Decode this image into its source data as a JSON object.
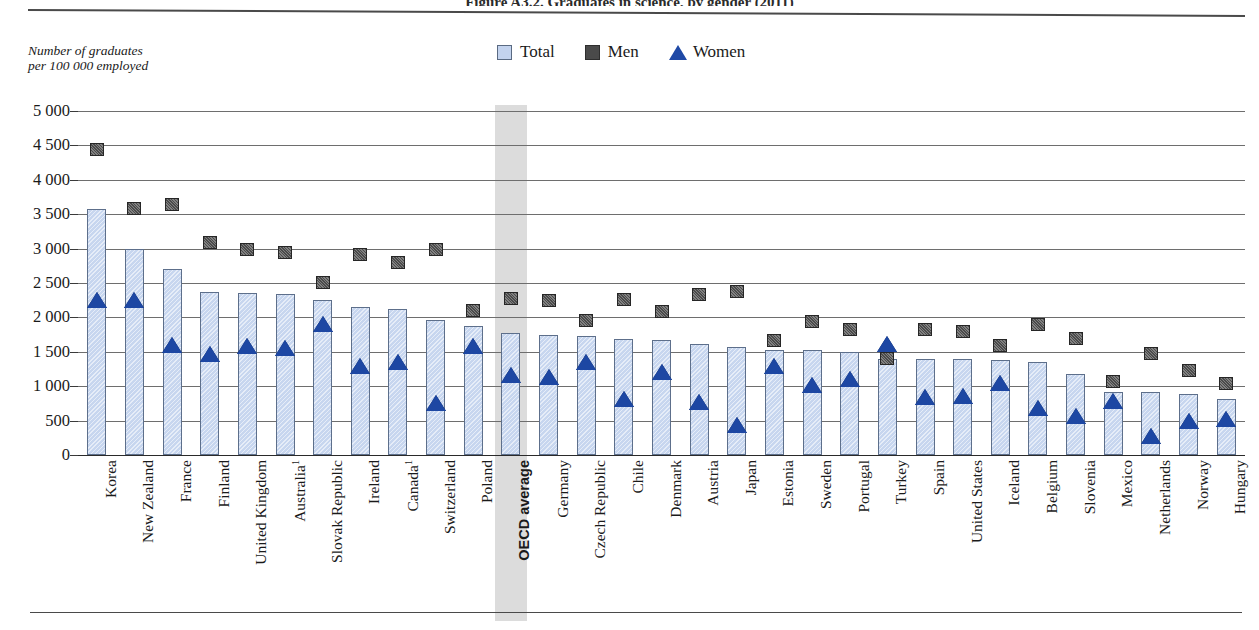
{
  "figure": {
    "top_title_partial": "Figure A3.2. Graduates in science, by gender (2011)",
    "axis_caption": "Number of graduates\nper 100 000 employed"
  },
  "legend": {
    "position": "top-center",
    "items": [
      {
        "label": "Total",
        "icon": "square-swatch-icon",
        "color": "#c3d3ee"
      },
      {
        "label": "Men",
        "icon": "square-swatch-icon",
        "color": "#4a4a4a"
      },
      {
        "label": "Women",
        "icon": "triangle-swatch-icon",
        "color": "#1f49a6"
      }
    ]
  },
  "yaxis": {
    "labels": [
      "5 000",
      "4 500",
      "4 000",
      "3 500",
      "3 000",
      "2 500",
      "2 000",
      "1 500",
      "1 000",
      "500",
      "0"
    ],
    "min": 0,
    "max": 5000,
    "step": 500
  },
  "highlight": {
    "category": "OECD average",
    "band_color": "#dcdcdc"
  },
  "chart_data": {
    "type": "bar",
    "title": "Graduates in science, by gender (2011)",
    "xlabel": "",
    "ylabel": "Number of graduates per 100 000 employed",
    "ylim": [
      0,
      5000
    ],
    "ytick_step": 500,
    "grid": true,
    "legend_position": "top-center",
    "categories": [
      "Korea",
      "New Zealand",
      "France",
      "Finland",
      "United Kingdom",
      "Australia¹",
      "Slovak Republic",
      "Ireland",
      "Canada¹",
      "Switzerland",
      "Poland",
      "OECD average",
      "Germany",
      "Czech Republic",
      "Chile",
      "Denmark",
      "Austria",
      "Japan",
      "Estonia",
      "Sweden",
      "Portugal",
      "Turkey",
      "Spain",
      "United States",
      "Iceland",
      "Belgium",
      "Slovenia",
      "Mexico",
      "Netherlands",
      "Norway",
      "Hungary"
    ],
    "series": [
      {
        "name": "Total",
        "mark": "bar",
        "color": "#c7d6ef",
        "values": [
          3570,
          2990,
          2710,
          2370,
          2360,
          2340,
          2250,
          2150,
          2120,
          1960,
          1880,
          1780,
          1740,
          1730,
          1680,
          1670,
          1610,
          1570,
          1530,
          1520,
          1500,
          1400,
          1400,
          1390,
          1380,
          1350,
          1180,
          920,
          910,
          890,
          820
        ]
      },
      {
        "name": "Men",
        "mark": "square",
        "color": "#4b4b4b",
        "values": [
          4440,
          3590,
          3640,
          3090,
          2990,
          2940,
          2510,
          2920,
          2800,
          2990,
          2100,
          2270,
          2240,
          1960,
          2260,
          2080,
          2340,
          2370,
          1670,
          1940,
          1830,
          1400,
          1820,
          1790,
          1590,
          1900,
          1690,
          1070,
          1470,
          1230,
          1040
        ]
      },
      {
        "name": "Women",
        "mark": "triangle",
        "color": "#1d47a3",
        "values": [
          2250,
          2250,
          1600,
          1470,
          1580,
          1550,
          1900,
          1300,
          1350,
          760,
          1590,
          1160,
          1130,
          1350,
          810,
          1210,
          770,
          440,
          1300,
          1020,
          1110,
          1620,
          840,
          860,
          1040,
          690,
          560,
          790,
          270,
          490,
          520
        ]
      }
    ]
  }
}
